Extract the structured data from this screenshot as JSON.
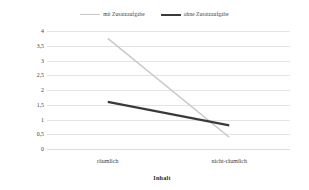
{
  "chart_data": {
    "type": "line",
    "title": "",
    "xlabel": "Inhalt",
    "ylabel": "Mittlere Fehleranzahl",
    "categories": [
      "räumlich",
      "nicht-räumlich"
    ],
    "yticks": [
      "4",
      "3,5",
      "3",
      "2,5",
      "2",
      "1,5",
      "1",
      "0,5",
      "0"
    ],
    "ytick_values": [
      4,
      3.5,
      3,
      2.5,
      2,
      1.5,
      1,
      0.5,
      0
    ],
    "ylim": [
      0,
      4
    ],
    "grid": true,
    "grid_axis": "y",
    "legend_position": "top-center",
    "series": [
      {
        "name": "mit Zusatzaufgabe",
        "values": [
          3.75,
          0.4
        ],
        "color": "#c8c8c8",
        "width": 1.4
      },
      {
        "name": "ohne Zusatzaufgabe",
        "values": [
          1.6,
          0.8
        ],
        "color": "#3a3a3a",
        "width": 2.2
      }
    ]
  },
  "legend": {
    "entries": [
      {
        "label": "mit Zusatzaufgabe",
        "swatch": "line-swatch-light"
      },
      {
        "label": "ohne Zusatzaufgabe",
        "swatch": "line-swatch-dark"
      }
    ]
  },
  "axes": {
    "y_title": "Mittlere Fehleranzahl",
    "x_title": "Inhalt"
  }
}
